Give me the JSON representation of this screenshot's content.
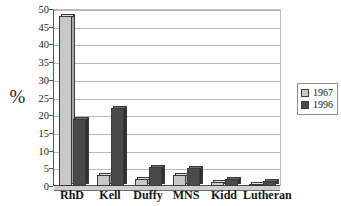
{
  "chart_data": {
    "type": "bar",
    "title": "",
    "xlabel": "",
    "ylabel": "%",
    "ylim": [
      0,
      50
    ],
    "yticks": [
      0,
      5,
      10,
      15,
      20,
      25,
      30,
      35,
      40,
      45,
      50
    ],
    "grid": true,
    "legend_position": "right",
    "categories": [
      "RhD",
      "Kell",
      "Duffy",
      "MNS",
      "Kidd",
      "Lutheran"
    ],
    "series": [
      {
        "name": "1967",
        "color": "#c8c8c8",
        "values": [
          48,
          3,
          2,
          3,
          1,
          0.5
        ]
      },
      {
        "name": "1996",
        "color": "#4a4a4a",
        "values": [
          19,
          22,
          5.5,
          5,
          2,
          1.5
        ]
      }
    ]
  },
  "legend": {
    "entries": [
      {
        "label": "1967",
        "swatch": "light-gray-swatch"
      },
      {
        "label": "1996",
        "swatch": "dark-gray-swatch"
      }
    ]
  }
}
